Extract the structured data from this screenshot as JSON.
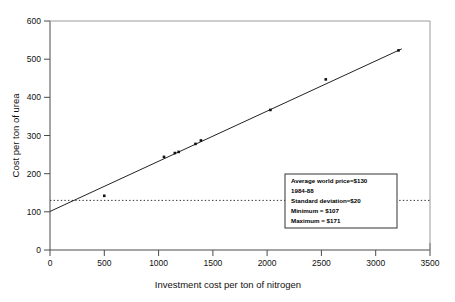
{
  "chart_data": {
    "type": "scatter",
    "title": "",
    "xlabel": "Investment cost per ton of nitrogen",
    "ylabel": "Cost per ton of urea",
    "xlim": [
      0,
      3500
    ],
    "ylim": [
      0,
      600
    ],
    "xticks": [
      0,
      500,
      1000,
      1500,
      2000,
      2500,
      3000,
      3500
    ],
    "yticks": [
      0,
      100,
      200,
      300,
      400,
      500,
      600
    ],
    "xticklabels": [
      "0",
      "500",
      "1000",
      "1500",
      "2000",
      "2500",
      "3000",
      "3500"
    ],
    "yticklabels": [
      "0",
      "100",
      "200",
      "300",
      "400",
      "500",
      "600"
    ],
    "grid": false,
    "legend": "none",
    "series": [
      {
        "name": "Urea cost vs investment cost",
        "marker": "square",
        "color": "#111111",
        "points": [
          {
            "x": 500,
            "y": 142
          },
          {
            "x": 1050,
            "y": 244
          },
          {
            "x": 1150,
            "y": 254
          },
          {
            "x": 1185,
            "y": 257
          },
          {
            "x": 1340,
            "y": 278
          },
          {
            "x": 1390,
            "y": 287
          },
          {
            "x": 2030,
            "y": 367
          },
          {
            "x": 2540,
            "y": 447
          },
          {
            "x": 3210,
            "y": 523
          }
        ]
      }
    ],
    "trendline": {
      "name": "fitted regression line",
      "x": [
        0,
        3240
      ],
      "y": [
        101,
        527
      ],
      "color": "#222222"
    },
    "reference_line": {
      "name": "average world price",
      "orientation": "horizontal",
      "y": 130,
      "style": "dotted",
      "color": "#333333"
    },
    "annotation_box": {
      "name": "statistics-box",
      "lines": [
        "Average world price=$130",
        "1984-88",
        "Standard deviation=$20",
        "Minimum   =  $107",
        "Maximum  =  $171"
      ]
    }
  }
}
